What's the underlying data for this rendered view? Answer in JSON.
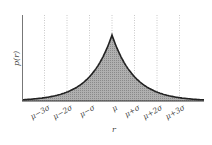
{
  "chart_data": {
    "type": "area",
    "title": "",
    "xlabel": "r",
    "ylabel": "p(r)",
    "distribution": "Laplace (double exponential)",
    "categories": [
      "μ−3σ",
      "μ−2σ",
      "μ−σ",
      "μ",
      "μ+σ",
      "μ+2σ",
      "μ+3σ"
    ],
    "x": [
      -3,
      -2,
      -1,
      0,
      1,
      2,
      3
    ],
    "values": [
      0.05,
      0.135,
      0.37,
      1.0,
      0.37,
      0.135,
      0.05
    ],
    "grid": {
      "vertical_dotted": true,
      "horizontal": false
    },
    "fill_color": "#a8a8a8",
    "line_color": "#222222",
    "legend": null
  },
  "labels": {
    "ylabel": "p(r)",
    "xlabel": "r",
    "ticks": [
      "μ−3σ",
      "μ−2σ",
      "μ−σ",
      "μ",
      "μ+σ",
      "μ+2σ",
      "μ+3σ"
    ]
  }
}
